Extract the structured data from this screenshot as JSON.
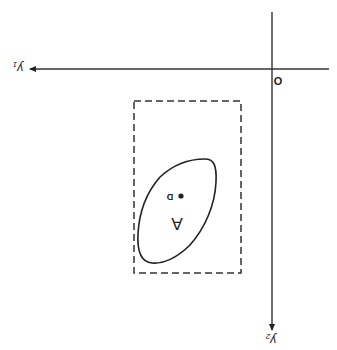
{
  "diagram": {
    "orientation": "rotated-180",
    "origin_label": "O",
    "axis_horizontal_label": "y1",
    "axis_horizontal_sub": "1",
    "axis_horizontal_main": "y",
    "axis_vertical_label": "y2",
    "axis_vertical_sub": "2",
    "axis_vertical_main": "y",
    "region_label": "A",
    "point_label": "D",
    "bounding_box": "dashed rectangle enclosing region A",
    "colors": {
      "ink": "#222222",
      "background": "#ffffff"
    }
  }
}
